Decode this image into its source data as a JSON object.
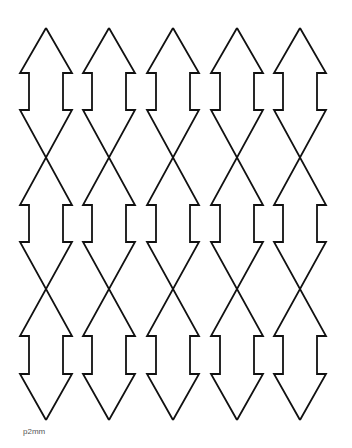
{
  "figure": {
    "caption": "p2mm",
    "stroke_color": "#111111",
    "background": "#ffffff",
    "columns": 5,
    "column_centers": [
      46,
      109,
      173,
      237,
      300
    ],
    "geometry": {
      "top_tip_y": 28,
      "upper_shaft_top_y": 73,
      "upper_shaft_bottom_y": 110,
      "middle_shaft_top_y": 205,
      "middle_shaft_bottom_y": 242,
      "lower_shaft_top_y": 336,
      "lower_shaft_bottom_y": 374,
      "bottom_tip_y": 420,
      "wide_half_width": 26,
      "shaft_half_width": 17
    }
  }
}
